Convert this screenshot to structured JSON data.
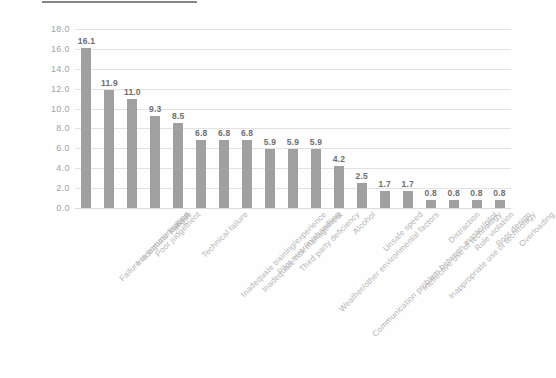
{
  "chart_data": {
    "type": "bar",
    "title": "",
    "subtitle": "",
    "xlabel": "",
    "ylabel": "",
    "ylim": [
      0.0,
      18.0
    ],
    "ytick_step": 2.0,
    "ytick_labels": [
      "18.0",
      "16.0",
      "14.0",
      "12.0",
      "10.0",
      "8.0",
      "6.0",
      "4.0",
      "2.0",
      "0.0"
    ],
    "ytick_values": [
      18.0,
      16.0,
      14.0,
      12.0,
      10.0,
      8.0,
      6.0,
      4.0,
      2.0,
      0.0
    ],
    "grid": true,
    "grid_orientation": "horizontal",
    "legend": false,
    "legend_position": "none",
    "bar_color": "#a0a0a0",
    "label_color": "#6f6f6f",
    "gridline_color": "#e2e2e2",
    "axis_text_color": "#a2a2a2",
    "category_text_color": "#b4b4b4",
    "background": "#fefefe",
    "categories": [
      "Failure in communication",
      "Inadequate lookout",
      "Poor judgement",
      "Fatigue",
      "Technical failure",
      "Inadequate training/experience",
      "Inadequate risk management",
      "Pilot error/mishandling",
      "Third party deficiency",
      "Weather/other environmental factors",
      "Communication problem between master/pilot",
      "Alcohol",
      "Unsafe speed",
      "Ineffective use of technology",
      "Inappropriate use of technology",
      "Distraction",
      "Rule violation",
      "Poor design",
      "Overloading"
    ],
    "values": [
      16.1,
      11.9,
      11.0,
      9.3,
      8.5,
      6.8,
      6.8,
      6.8,
      5.9,
      5.9,
      5.9,
      4.2,
      2.5,
      1.7,
      1.7,
      0.8,
      0.8,
      0.8,
      0.8
    ],
    "value_labels": [
      "16.1",
      "11.9",
      "11.0",
      "9.3",
      "8.5",
      "6.8",
      "6.8",
      "6.8",
      "5.9",
      "5.9",
      "5.9",
      "4.2",
      "2.5",
      "1.7",
      "1.7",
      "0.8",
      "0.8",
      "0.8",
      "0.8"
    ]
  }
}
